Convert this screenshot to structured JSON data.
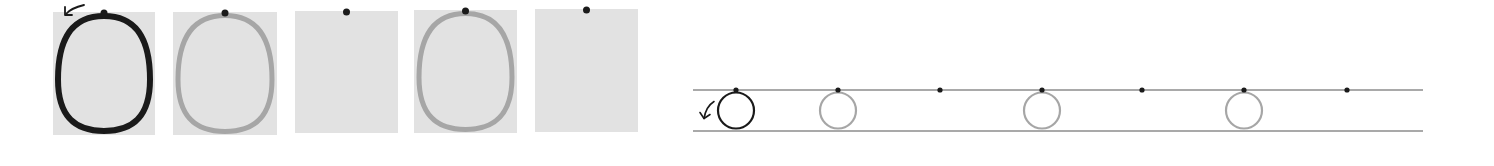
{
  "worksheet": {
    "letter": "o",
    "colors": {
      "box_fill": "#e2e2e2",
      "model_stroke": "#1a1a1a",
      "trace_stroke": "#a6a6a6",
      "dot": "#1a1a1a",
      "guide_line": "#8c8c8c"
    },
    "boxes": [
      {
        "x": 53,
        "y": 12,
        "w": 102,
        "h": 123,
        "oval": "model",
        "dot": true,
        "arrow": true
      },
      {
        "x": 173,
        "y": 12,
        "w": 104,
        "h": 123,
        "oval": "trace",
        "dot": true,
        "arrow": false
      },
      {
        "x": 295,
        "y": 11,
        "w": 103,
        "h": 122,
        "oval": "none",
        "dot": true,
        "arrow": false
      },
      {
        "x": 414,
        "y": 10,
        "w": 103,
        "h": 123,
        "oval": "trace",
        "dot": true,
        "arrow": false
      },
      {
        "x": 535,
        "y": 9,
        "w": 103,
        "h": 123,
        "oval": "none",
        "dot": true,
        "arrow": false
      }
    ],
    "lines_panel": {
      "x_start": 693,
      "x_end": 1423,
      "top_line_y": 90,
      "bottom_line_y": 131,
      "circle_radius": 19,
      "items": [
        {
          "x": 736,
          "circle": "model",
          "arrow": true
        },
        {
          "x": 838,
          "circle": "trace",
          "arrow": false
        },
        {
          "x": 940,
          "circle": "none",
          "arrow": false
        },
        {
          "x": 1042,
          "circle": "trace",
          "arrow": false
        },
        {
          "x": 1142,
          "circle": "none",
          "arrow": false
        },
        {
          "x": 1244,
          "circle": "trace",
          "arrow": false
        },
        {
          "x": 1347,
          "circle": "none",
          "arrow": false
        }
      ]
    }
  }
}
